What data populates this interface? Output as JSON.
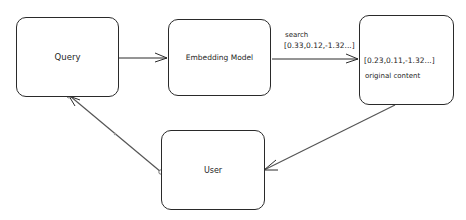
{
  "nodes": {
    "query": {
      "label": "Query"
    },
    "embedding": {
      "label": "Embedding Model"
    },
    "store": {
      "vector": "[0.23,0.11,-1.32...]",
      "content": "original content"
    },
    "user": {
      "label": "User"
    }
  },
  "edges": {
    "search": {
      "label": "search",
      "vector": "[0.33,0.12,-1.32...]"
    }
  },
  "colors": {
    "stroke": "#2a2a2a",
    "background": "#ffffff"
  }
}
